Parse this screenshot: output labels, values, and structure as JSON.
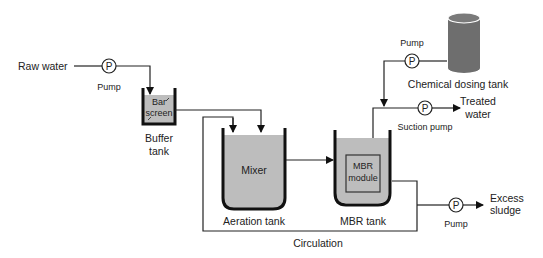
{
  "diagram": {
    "type": "process-flow",
    "labels": {
      "raw_water": "Raw water",
      "pump_inlet": "Pump",
      "bar_screen_1": "Bar",
      "bar_screen_2": "screen",
      "buffer_tank_1": "Buffer",
      "buffer_tank_2": "tank",
      "mixer": "Mixer",
      "aeration_tank": "Aeration tank",
      "mbr_module_1": "MBR",
      "mbr_module_2": "module",
      "mbr_tank": "MBR  tank",
      "circulation": "Circulation",
      "pump_dosing": "Pump",
      "chemical_dosing_tank": "Chemical dosing tank",
      "suction_pump": "Suction pump",
      "treated_water_1": "Treated",
      "treated_water_2": "water",
      "pump_sludge": "Pump",
      "excess_sludge_1": "Excess",
      "excess_sludge_2": "sludge",
      "pump_symbol": "P"
    },
    "colors": {
      "tank_fill": "#bdbdbd",
      "dosing_tank_fill": "#6e6e6e",
      "line": "#222222"
    }
  }
}
